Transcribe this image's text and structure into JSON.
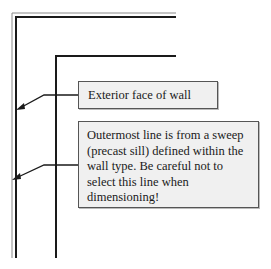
{
  "diagram": {
    "type": "wall-section-annotation",
    "callouts": [
      {
        "id": "exterior-face",
        "text": "Exterior face of wall"
      },
      {
        "id": "outermost-line",
        "text": "Outermost line is from a sweep (precast sill) defined within the wall type. Be careful not to select this line when dimensioning!"
      }
    ],
    "colors": {
      "line": "#1a1a1a",
      "thin_line": "#8a8a8a",
      "callout_fill": "#f0f0f0",
      "callout_border": "#555555"
    }
  }
}
